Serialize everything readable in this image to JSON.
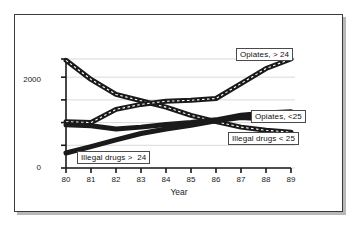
{
  "chart_data": {
    "type": "line",
    "title": "",
    "subtitle": "",
    "xlabel": "Year",
    "ylabel": "",
    "x": [
      80,
      81,
      82,
      83,
      84,
      85,
      86,
      87,
      88,
      89
    ],
    "xtick_labels": [
      "80",
      "81",
      "82",
      "83",
      "84",
      "85",
      "86",
      "87",
      "88",
      "89"
    ],
    "ytick_labels": [
      "0",
      "2000"
    ],
    "ytick_values": [
      0,
      500,
      1000,
      1500,
      2000,
      2400
    ],
    "ylim": [
      0,
      2400
    ],
    "xlim": [
      80,
      89
    ],
    "grid": "horizontal",
    "legend_position": "inline-callout-boxes",
    "series": [
      {
        "name": "Opiates, > 24",
        "label": "Opiates, > 24",
        "values": [
          2370,
          1950,
          1620,
          1480,
          1340,
          1160,
          1020,
          900,
          830,
          790
        ],
        "color": "#1a1a1a",
        "style": "thick-dashed-band"
      },
      {
        "name": "Opiates, <25",
        "label": "Opiates, <25",
        "values": [
          1020,
          1000,
          1290,
          1400,
          1470,
          1490,
          1530,
          1860,
          2190,
          2400
        ],
        "color": "#1a1a1a",
        "style": "thick-dashed-band"
      },
      {
        "name": "Illegal drugs < 25",
        "label": "Illegal drugs < 25",
        "values": [
          950,
          930,
          860,
          900,
          960,
          1000,
          1060,
          1160,
          1210,
          1240
        ],
        "color": "#1a1a1a",
        "style": "thick-solid-band"
      },
      {
        "name": "Illegal drugs >  24",
        "label": "Illegal drugs >  24",
        "values": [
          330,
          470,
          620,
          760,
          860,
          940,
          1040,
          1110,
          1080,
          1070
        ],
        "color": "#1a1a1a",
        "style": "thick-solid-band"
      }
    ],
    "annotations": [
      {
        "name": "Opiates, > 24",
        "points_to": "series-opiates-over-24"
      },
      {
        "name": "Opiates, <25",
        "points_to": "series-opiates-under-25"
      },
      {
        "name": "Illegal drugs < 25",
        "points_to": "series-illegal-under-25"
      },
      {
        "name": "Illegal drugs >  24",
        "points_to": "series-illegal-over-24"
      }
    ]
  },
  "axes": {
    "y_labels": [
      {
        "text": "2000"
      },
      {
        "text": "0"
      }
    ],
    "x_labels": [
      {
        "text": "80"
      },
      {
        "text": "81"
      },
      {
        "text": "82"
      },
      {
        "text": "83"
      },
      {
        "text": "84"
      },
      {
        "text": "85"
      },
      {
        "text": "86"
      },
      {
        "text": "87"
      },
      {
        "text": "88"
      },
      {
        "text": "89"
      }
    ],
    "x_title": "Year"
  },
  "legend": {
    "opiates_over_24": "Opiates, > 24",
    "opiates_under_25": "Opiates, <25",
    "illegal_under_25": "Illegal drugs < 25",
    "illegal_over_24": "Illegal drugs >  24"
  },
  "colors": {
    "frame": "#3a3a3a",
    "shadow": "#b8b8b8",
    "ink": "#1a1a1a",
    "grid": "#c9c9c9",
    "paper": "#ffffff"
  }
}
